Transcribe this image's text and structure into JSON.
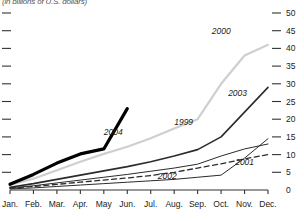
{
  "subtitle": "(in billions of U.S. dollars)",
  "chart_data": {
    "type": "line",
    "title": "",
    "subtitle": "(in billions of U.S. dollars)",
    "xlabel": "",
    "ylabel": "",
    "ylim": [
      0,
      50
    ],
    "ytick_labels": [
      "0",
      "5",
      "10",
      "15",
      "20",
      "25",
      "30",
      "35",
      "40",
      "45",
      "50"
    ],
    "ytick_values": [
      0,
      5,
      10,
      15,
      20,
      25,
      30,
      35,
      40,
      45,
      50
    ],
    "yaxis_position": "right",
    "grid": false,
    "legend": "inline-labels",
    "categories": [
      "Jan.",
      "Feb.",
      "Mar.",
      "Apr.",
      "May",
      "Jun.",
      "Jul.",
      "Aug.",
      "Sep.",
      "Oct.",
      "Nov.",
      "Dec."
    ],
    "series": [
      {
        "name": "1999",
        "label": "1999",
        "color": "#2b2b2b",
        "style": "solid",
        "width": 1,
        "values": [
          0.6,
          1.2,
          2.0,
          2.8,
          3.6,
          4.4,
          5.3,
          6.2,
          7.3,
          9.6,
          11.6,
          13.0
        ],
        "label_x": 7.0,
        "label_y": 18.5
      },
      {
        "name": "2000",
        "label": "2000",
        "color": "#cfcfcf",
        "style": "solid",
        "width": 2.2,
        "values": [
          1.4,
          3.2,
          5.6,
          8.0,
          10.2,
          12.2,
          14.6,
          17.4,
          20.0,
          30.0,
          38.0,
          41.0
        ],
        "label_x": 8.6,
        "label_y": 44.0
      },
      {
        "name": "2001",
        "label": "2001",
        "color": "#2b2b2b",
        "style": "dashed",
        "width": 1.3,
        "values": [
          0.5,
          1.0,
          1.6,
          2.2,
          2.8,
          3.4,
          4.1,
          5.0,
          6.2,
          7.4,
          8.8,
          10.0
        ],
        "label_x": 9.6,
        "label_y": 7.0
      },
      {
        "name": "2002",
        "label": "2002",
        "color": "#2b2b2b",
        "style": "solid",
        "width": 1,
        "values": [
          0.3,
          0.6,
          1.0,
          1.4,
          1.8,
          2.2,
          2.6,
          3.0,
          3.6,
          4.2,
          9.0,
          14.5
        ],
        "label_x": 6.3,
        "label_y": 3.2
      },
      {
        "name": "2003",
        "label": "2003",
        "color": "#2b2b2b",
        "style": "solid",
        "width": 1.6,
        "values": [
          0.8,
          1.8,
          3.0,
          4.2,
          5.4,
          6.6,
          8.0,
          9.6,
          11.4,
          15.0,
          22.0,
          29.0
        ],
        "label_x": 9.3,
        "label_y": 26.5
      },
      {
        "name": "2004",
        "label": "2004",
        "color": "#000000",
        "style": "solid",
        "width": 3.2,
        "values": [
          1.6,
          4.4,
          7.6,
          10.2,
          11.6,
          23.0,
          null,
          null,
          null,
          null,
          null,
          null
        ],
        "label_x": 4.0,
        "label_y": 15.5
      }
    ]
  }
}
